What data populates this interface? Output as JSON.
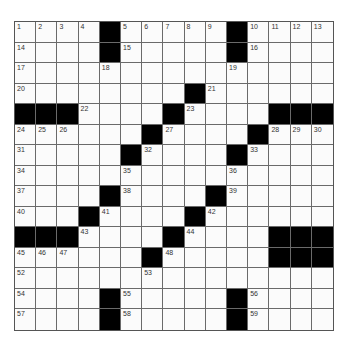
{
  "puzzle": {
    "rows": 15,
    "cols": 15,
    "colors": {
      "black": "#000000",
      "white": "#fbfbfb",
      "line": "#6a6a6a"
    },
    "grid": [
      "....#.....#....",
      "....#.....#....",
      "...............",
      "........#......",
      "###....#....###",
      "......#....#...",
      ".....#....#....",
      "...............",
      "....#....#.....",
      "...#....#......",
      "###....#....###",
      "......#.....###",
      "...............",
      "....#.....#....",
      "....#.....#...."
    ],
    "numbers": [
      {
        "r": 0,
        "c": 0,
        "n": "1"
      },
      {
        "r": 0,
        "c": 1,
        "n": "2"
      },
      {
        "r": 0,
        "c": 2,
        "n": "3"
      },
      {
        "r": 0,
        "c": 3,
        "n": "4"
      },
      {
        "r": 0,
        "c": 5,
        "n": "5"
      },
      {
        "r": 0,
        "c": 6,
        "n": "6"
      },
      {
        "r": 0,
        "c": 7,
        "n": "7"
      },
      {
        "r": 0,
        "c": 8,
        "n": "8"
      },
      {
        "r": 0,
        "c": 9,
        "n": "9"
      },
      {
        "r": 0,
        "c": 11,
        "n": "10"
      },
      {
        "r": 0,
        "c": 12,
        "n": "11"
      },
      {
        "r": 0,
        "c": 13,
        "n": "12"
      },
      {
        "r": 0,
        "c": 14,
        "n": "13"
      },
      {
        "r": 1,
        "c": 0,
        "n": "14"
      },
      {
        "r": 1,
        "c": 5,
        "n": "15"
      },
      {
        "r": 1,
        "c": 11,
        "n": "16"
      },
      {
        "r": 2,
        "c": 0,
        "n": "17"
      },
      {
        "r": 2,
        "c": 4,
        "n": "18"
      },
      {
        "r": 2,
        "c": 10,
        "n": "19"
      },
      {
        "r": 3,
        "c": 0,
        "n": "20"
      },
      {
        "r": 3,
        "c": 9,
        "n": "21"
      },
      {
        "r": 4,
        "c": 3,
        "n": "22"
      },
      {
        "r": 4,
        "c": 8,
        "n": "23"
      },
      {
        "r": 5,
        "c": 0,
        "n": "24"
      },
      {
        "r": 5,
        "c": 1,
        "n": "25"
      },
      {
        "r": 5,
        "c": 2,
        "n": "26"
      },
      {
        "r": 5,
        "c": 7,
        "n": "27"
      },
      {
        "r": 5,
        "c": 12,
        "n": "28"
      },
      {
        "r": 5,
        "c": 13,
        "n": "29"
      },
      {
        "r": 5,
        "c": 14,
        "n": "30"
      },
      {
        "r": 6,
        "c": 0,
        "n": "31"
      },
      {
        "r": 6,
        "c": 6,
        "n": "32"
      },
      {
        "r": 6,
        "c": 11,
        "n": "33"
      },
      {
        "r": 7,
        "c": 0,
        "n": "34"
      },
      {
        "r": 7,
        "c": 5,
        "n": "35"
      },
      {
        "r": 7,
        "c": 10,
        "n": "36"
      },
      {
        "r": 8,
        "c": 0,
        "n": "37"
      },
      {
        "r": 8,
        "c": 5,
        "n": "38"
      },
      {
        "r": 8,
        "c": 10,
        "n": "39"
      },
      {
        "r": 9,
        "c": 0,
        "n": "40"
      },
      {
        "r": 9,
        "c": 4,
        "n": "41"
      },
      {
        "r": 9,
        "c": 9,
        "n": "42"
      },
      {
        "r": 10,
        "c": 3,
        "n": "43"
      },
      {
        "r": 10,
        "c": 8,
        "n": "44"
      },
      {
        "r": 11,
        "c": 0,
        "n": "45"
      },
      {
        "r": 11,
        "c": 1,
        "n": "46"
      },
      {
        "r": 11,
        "c": 2,
        "n": "47"
      },
      {
        "r": 11,
        "c": 7,
        "n": "48"
      },
      {
        "r": 11,
        "c": 12,
        "n": "49"
      },
      {
        "r": 11,
        "c": 13,
        "n": "50"
      },
      {
        "r": 11,
        "c": 14,
        "n": "51"
      },
      {
        "r": 12,
        "c": 0,
        "n": "52"
      },
      {
        "r": 12,
        "c": 6,
        "n": "53"
      },
      {
        "r": 13,
        "c": 0,
        "n": "54"
      },
      {
        "r": 13,
        "c": 5,
        "n": "55"
      },
      {
        "r": 13,
        "c": 11,
        "n": "56"
      },
      {
        "r": 14,
        "c": 0,
        "n": "57"
      },
      {
        "r": 14,
        "c": 5,
        "n": "58"
      },
      {
        "r": 14,
        "c": 11,
        "n": "59"
      }
    ]
  }
}
